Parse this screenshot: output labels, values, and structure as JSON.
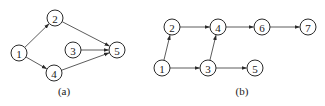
{
  "diagrams": [
    {
      "id": "a",
      "caption": "(a)",
      "nodes": [
        {
          "id": "1",
          "label": "1"
        },
        {
          "id": "2",
          "label": "2"
        },
        {
          "id": "3",
          "label": "3"
        },
        {
          "id": "4",
          "label": "4"
        },
        {
          "id": "5",
          "label": "5"
        }
      ],
      "edges": [
        {
          "from": "1",
          "to": "2"
        },
        {
          "from": "1",
          "to": "4"
        },
        {
          "from": "2",
          "to": "5"
        },
        {
          "from": "3",
          "to": "5"
        },
        {
          "from": "4",
          "to": "5"
        }
      ]
    },
    {
      "id": "b",
      "caption": "(b)",
      "nodes": [
        {
          "id": "1",
          "label": "1"
        },
        {
          "id": "2",
          "label": "2"
        },
        {
          "id": "3",
          "label": "3"
        },
        {
          "id": "4",
          "label": "4"
        },
        {
          "id": "5",
          "label": "5"
        },
        {
          "id": "6",
          "label": "6"
        },
        {
          "id": "7",
          "label": "7"
        }
      ],
      "edges": [
        {
          "from": "1",
          "to": "2"
        },
        {
          "from": "1",
          "to": "3"
        },
        {
          "from": "2",
          "to": "4"
        },
        {
          "from": "3",
          "to": "4"
        },
        {
          "from": "3",
          "to": "5"
        },
        {
          "from": "4",
          "to": "6"
        },
        {
          "from": "6",
          "to": "7"
        }
      ]
    }
  ]
}
